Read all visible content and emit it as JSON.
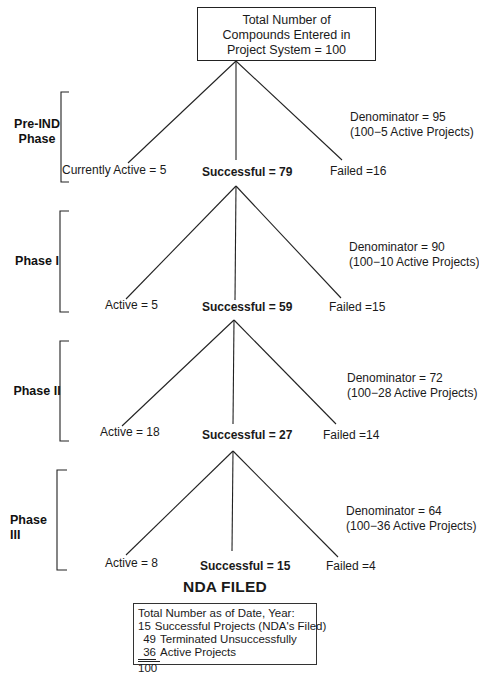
{
  "top_box": {
    "lines": [
      "Total Number of",
      "Compounds Entered in",
      "Project System = 100"
    ]
  },
  "phases": [
    {
      "label_lines": [
        "Pre-IND",
        "Phase"
      ],
      "active_label": "Currently Active = 5",
      "successful_label": "Successful = 79",
      "failed_label": "Failed =16",
      "denominator": "Denominator = 95",
      "denominator_note": "(100−5 Active Projects)"
    },
    {
      "label_lines": [
        "Phase I"
      ],
      "active_label": "Active = 5",
      "successful_label": "Successful = 59",
      "failed_label": "Failed =15",
      "denominator": "Denominator = 90",
      "denominator_note": "(100−10 Active Projects)"
    },
    {
      "label_lines": [
        "Phase II"
      ],
      "active_label": "Active = 18",
      "successful_label": "Successful = 27",
      "failed_label": "Failed =14",
      "denominator": "Denominator = 72",
      "denominator_note": "(100−28 Active Projects)"
    },
    {
      "label_lines": [
        "Phase III"
      ],
      "active_label": "Active = 8",
      "successful_label": "Successful = 15",
      "failed_label": "Failed =4",
      "denominator": "Denominator = 64",
      "denominator_note": "(100−36 Active Projects)"
    }
  ],
  "nda_title": "NDA FILED",
  "summary_box": {
    "heading": "Total Number as of Date, Year:",
    "rows": [
      {
        "num": "15",
        "text": "Successful Projects (NDA's Filed)"
      },
      {
        "num": "49",
        "text": "Terminated Unsuccessfully"
      },
      {
        "num": "36",
        "text": "Active Projects"
      }
    ],
    "total": "100"
  },
  "colors": {
    "line": "#222222",
    "text": "#1a1a1a",
    "background": "#ffffff"
  }
}
